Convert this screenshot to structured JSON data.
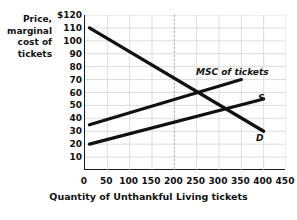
{
  "chart_data": {
    "type": "line",
    "title": "",
    "xlabel": "Quantity of Unthankful Living tickets",
    "ylabel_lines": [
      "Price,",
      "marginal",
      "cost of",
      "tickets"
    ],
    "ylabel": "Price, marginal cost of tickets",
    "xlim": [
      0,
      450
    ],
    "ylim": [
      0,
      120
    ],
    "xticks": [
      0,
      50,
      100,
      150,
      200,
      250,
      300,
      350,
      400,
      450
    ],
    "xtick_labels": [
      "0",
      "50",
      "100",
      "150",
      "200",
      "250",
      "300",
      "350",
      "400",
      "450"
    ],
    "yticks": [
      10,
      20,
      30,
      40,
      50,
      60,
      70,
      80,
      90,
      100,
      110,
      120
    ],
    "ytick_labels": [
      "10",
      "20",
      "30",
      "40",
      "50",
      "60",
      "70",
      "80",
      "90",
      "100",
      "110",
      "$120"
    ],
    "grid": true,
    "legend_position": "inline-annotations",
    "series": [
      {
        "name": "MSC of tickets",
        "label": "MSC of tickets",
        "kind": "marginal-social-cost",
        "color": "#111111",
        "x": [
          10,
          350
        ],
        "y": [
          35,
          70
        ]
      },
      {
        "name": "S",
        "label": "S",
        "kind": "supply",
        "color": "#111111",
        "x": [
          10,
          400
        ],
        "y": [
          20,
          55
        ]
      },
      {
        "name": "D",
        "label": "D",
        "kind": "demand",
        "color": "#111111",
        "x": [
          10,
          400
        ],
        "y": [
          110,
          30
        ]
      }
    ],
    "annotations": [
      {
        "name": "msc-curve-label",
        "text": "MSC of tickets"
      },
      {
        "name": "supply-curve-label",
        "text": "S"
      },
      {
        "name": "demand-curve-label",
        "text": "D"
      }
    ],
    "dotted_marker_x": 200,
    "market_equilibrium": {
      "quantity": 250,
      "price": 50
    },
    "efficient_quantity": {
      "quantity": 200,
      "price": 65
    }
  }
}
